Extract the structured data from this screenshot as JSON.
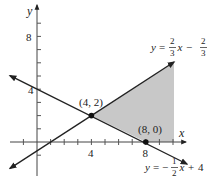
{
  "figure": {
    "type": "system-of-inequalities-graph",
    "axes": {
      "x_label": "x",
      "y_label": "y",
      "x_tick_labels": [
        "4",
        "8"
      ],
      "y_tick_labels": [
        "4",
        "8"
      ]
    },
    "lines": [
      {
        "name": "upper-line",
        "equation_prefix": "y =",
        "coef_num": "2",
        "coef_den": "3",
        "var": "x",
        "op": "−",
        "const_num": "2",
        "const_den": "3"
      },
      {
        "name": "lower-line",
        "equation_prefix": "y = −",
        "coef_num": "1",
        "coef_den": "2",
        "var": "x",
        "op": "+",
        "const": "4"
      }
    ],
    "points": [
      {
        "label": "(4, 2)",
        "x": 4,
        "y": 2
      },
      {
        "label": "(8, 0)",
        "x": 8,
        "y": 0
      }
    ],
    "colors": {
      "shade": "#c8c8c8",
      "line": "#222222",
      "axis": "#444444"
    }
  }
}
